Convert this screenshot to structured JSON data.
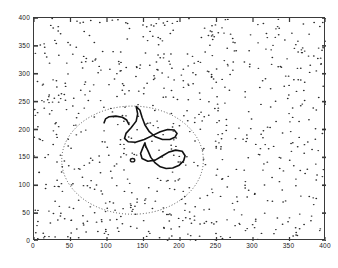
{
  "chart_data": {
    "type": "scatter",
    "title": "",
    "xlabel": "",
    "ylabel": "",
    "xlim": [
      0,
      400
    ],
    "ylim": [
      0,
      400
    ],
    "grid": false,
    "legend": null,
    "xticks": [
      0,
      50,
      100,
      150,
      200,
      250,
      300,
      350,
      400
    ],
    "yticks": [
      0,
      50,
      100,
      150,
      200,
      250,
      300,
      350,
      400
    ],
    "xtick_labels": [
      "0",
      "50",
      "100",
      "150",
      "200",
      "250",
      "300",
      "350",
      "400"
    ],
    "ytick_labels": [
      "0",
      "50",
      "100",
      "150",
      "200",
      "250",
      "300",
      "350",
      "400"
    ],
    "marker": "dot",
    "marker_color": "#2b2b2b",
    "point_count": 760,
    "series": [
      {
        "name": "scattered points",
        "marker": "dot",
        "color": "#2b2b2b",
        "note": "uniform random points across the full 0-400 by 0-400 domain"
      }
    ],
    "annotations": [
      {
        "name": "dotted-circle",
        "shape": "circle",
        "style": "dotted",
        "color": "#555555",
        "center": [
          135,
          145
        ],
        "radius": 97
      },
      {
        "name": "center-marker",
        "shape": "small-open-circle",
        "style": "solid",
        "color": "#1a1a1a",
        "center": [
          135,
          145
        ],
        "radius": 3
      },
      {
        "name": "contour-arc-left",
        "shape": "open-curve",
        "style": "solid-bold",
        "color": "#111111",
        "points": [
          [
            96,
            212
          ],
          [
            98,
            219
          ],
          [
            103,
            223
          ],
          [
            112,
            224
          ],
          [
            121,
            222
          ],
          [
            127,
            217
          ],
          [
            130,
            209
          ]
        ]
      },
      {
        "name": "contour-loop-upper",
        "shape": "closed-curve",
        "style": "solid-bold",
        "color": "#111111",
        "points": [
          [
            140,
            241
          ],
          [
            142,
            228
          ],
          [
            140,
            215
          ],
          [
            133,
            203
          ],
          [
            126,
            193
          ],
          [
            124,
            184
          ],
          [
            129,
            178
          ],
          [
            139,
            177
          ],
          [
            151,
            182
          ],
          [
            162,
            189
          ],
          [
            173,
            196
          ],
          [
            183,
            200
          ],
          [
            192,
            199
          ],
          [
            196,
            193
          ],
          [
            193,
            186
          ],
          [
            186,
            182
          ],
          [
            176,
            182
          ],
          [
            166,
            187
          ],
          [
            158,
            196
          ],
          [
            152,
            208
          ],
          [
            148,
            222
          ],
          [
            145,
            235
          ],
          [
            140,
            241
          ]
        ]
      },
      {
        "name": "contour-loop-lower",
        "shape": "closed-curve",
        "style": "solid-bold",
        "color": "#111111",
        "points": [
          [
            152,
            176
          ],
          [
            149,
            167
          ],
          [
            146,
            157
          ],
          [
            148,
            148
          ],
          [
            156,
            143
          ],
          [
            166,
            145
          ],
          [
            175,
            152
          ],
          [
            184,
            159
          ],
          [
            194,
            163
          ],
          [
            203,
            161
          ],
          [
            207,
            153
          ],
          [
            205,
            144
          ],
          [
            199,
            136
          ],
          [
            190,
            131
          ],
          [
            181,
            130
          ],
          [
            173,
            133
          ],
          [
            166,
            140
          ],
          [
            160,
            150
          ],
          [
            156,
            162
          ],
          [
            153,
            170
          ],
          [
            152,
            176
          ]
        ]
      }
    ]
  },
  "axes": {
    "frame_color": "#3a3a3a",
    "tick_direction": "in",
    "background": "#ffffff"
  }
}
